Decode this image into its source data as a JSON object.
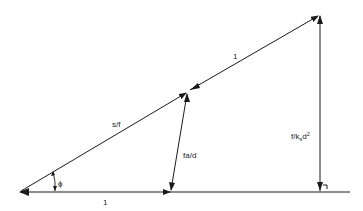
{
  "diagram": {
    "type": "vector-triangle",
    "labels": {
      "hypotenuse_lower": "s/f",
      "hypotenuse_upper": "1",
      "base": "1",
      "inner_vector": "fa/d",
      "vertical": {
        "main": "f/k",
        "subscript": "s",
        "after": "d",
        "superscript": "2"
      },
      "angle": "ϕ"
    },
    "colors": {
      "line": "#1a1a1a",
      "background": "#ffffff"
    }
  }
}
